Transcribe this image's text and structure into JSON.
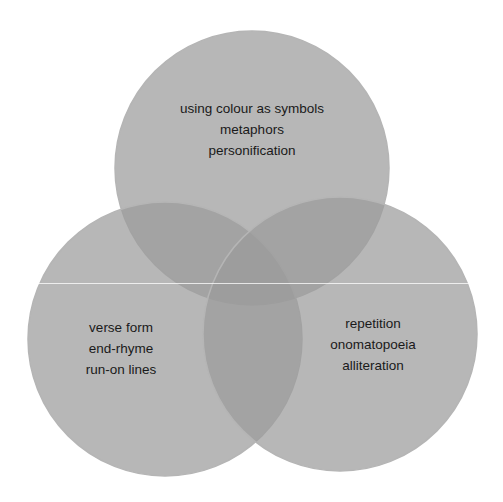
{
  "diagram": {
    "type": "venn",
    "colors": {
      "background": "#ffffff",
      "circle_fill": "#9b9b9b",
      "circle_edge": "#8a8a8a",
      "text": "#1a1a1a"
    },
    "circles": [
      {
        "id": "top",
        "lines": [
          "using colour as symbols",
          "metaphors",
          "personification"
        ]
      },
      {
        "id": "left",
        "lines": [
          "verse form",
          "end-rhyme",
          "run-on lines"
        ]
      },
      {
        "id": "right",
        "lines": [
          "repetition",
          "onomatopoeia",
          "alliteration"
        ]
      }
    ]
  }
}
